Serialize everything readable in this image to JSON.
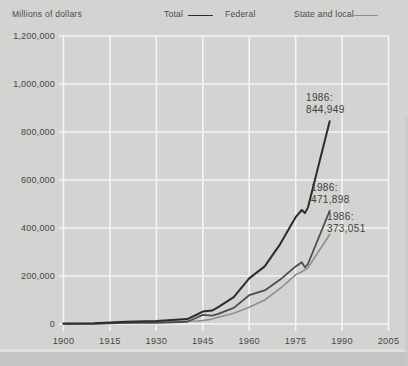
{
  "figure": {
    "ylabel": "Millions of dollars",
    "background": "#d3d3d1",
    "page_edge_color": "#c5c5c3",
    "text_color": "#454545"
  },
  "legend": {
    "items": [
      {
        "label": "Total",
        "swatch": true
      },
      {
        "label": "Federal",
        "swatch": false
      },
      {
        "label": "State and local",
        "swatch": true
      }
    ]
  },
  "chart_data": {
    "type": "line",
    "title": "",
    "ylabel": "Millions of dollars",
    "xlabel": "",
    "xlim": [
      1900,
      2005
    ],
    "ylim": [
      0,
      1200000
    ],
    "grid": true,
    "gridline_color": "#f6f6f4",
    "legend_position": "top",
    "xticks": [
      1900,
      1915,
      1930,
      1945,
      1960,
      1975,
      1990,
      2005
    ],
    "ytick_values": [
      0,
      200000,
      400000,
      600000,
      800000,
      1000000,
      1200000
    ],
    "ytick_labels": [
      "0",
      "200,000",
      "400,000",
      "600,000",
      "800,000",
      "1,000,000",
      "1,200,000"
    ],
    "x": [
      1900,
      1910,
      1920,
      1930,
      1940,
      1943,
      1945,
      1948,
      1950,
      1955,
      1960,
      1965,
      1970,
      1975,
      1977,
      1978,
      1979,
      1986
    ],
    "series": [
      {
        "name": "Total",
        "color": "#2c2c2c",
        "values": [
          1700,
          3000,
          9500,
          12500,
          20500,
          38500,
          52000,
          56000,
          70000,
          112000,
          190000,
          240000,
          333000,
          445000,
          475000,
          462000,
          486000,
          844949
        ]
      },
      {
        "name": "Federal",
        "color": "#4d4d4d",
        "values": [
          600,
          1000,
          4700,
          4300,
          9300,
          26000,
          38000,
          35000,
          42000,
          67000,
          120000,
          140000,
          185000,
          240000,
          257000,
          236000,
          251000,
          471898
        ]
      },
      {
        "name": "State and local",
        "color": "#8e8e8c",
        "values": [
          1100,
          2000,
          4800,
          8200,
          11200,
          12500,
          14000,
          21000,
          28000,
          45000,
          70000,
          100000,
          148000,
          205000,
          218000,
          226000,
          235000,
          373051
        ]
      }
    ],
    "annotations": [
      {
        "series": "Total",
        "year": 1986,
        "value": 844949,
        "line1": "1986:",
        "line2": "844,949"
      },
      {
        "series": "Federal",
        "year": 1986,
        "value": 471898,
        "line1": "1986:",
        "line2": "471,898"
      },
      {
        "series": "State and local",
        "year": 1986,
        "value": 373051,
        "line1": "1986:",
        "line2": "373,051"
      }
    ]
  }
}
